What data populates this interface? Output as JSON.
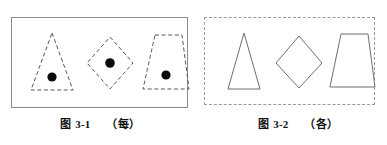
{
  "figures": [
    {
      "id": "figure-3-1",
      "panel_border_style": "solid",
      "caption": {
        "label": "图",
        "number": "3-1",
        "note": "（每）"
      },
      "shapes": [
        {
          "name": "triangle",
          "outline": "dashed",
          "has_dot": true
        },
        {
          "name": "diamond",
          "outline": "dashed",
          "has_dot": true
        },
        {
          "name": "trapezoid",
          "outline": "dashed",
          "has_dot": true
        }
      ]
    },
    {
      "id": "figure-3-2",
      "panel_border_style": "dashed",
      "caption": {
        "label": "图",
        "number": "3-2",
        "note": "（各）"
      },
      "shapes": [
        {
          "name": "triangle",
          "outline": "solid",
          "has_dot": false
        },
        {
          "name": "diamond",
          "outline": "solid",
          "has_dot": false
        },
        {
          "name": "trapezoid",
          "outline": "solid",
          "has_dot": false
        }
      ]
    }
  ],
  "colors": {
    "background": "#ffffff",
    "shape_stroke": "#6f6f6f",
    "dashed_stroke": "#585858",
    "dot_fill": "#0b0b0b",
    "caption_text": "#111111"
  }
}
